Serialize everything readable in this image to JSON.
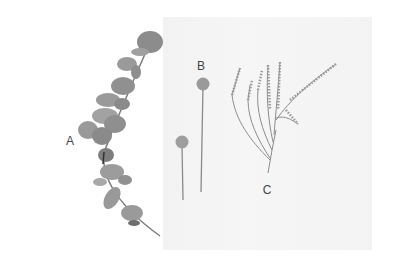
{
  "image": {
    "description": "Photo of three dried botanical specimens on a white cloth, labeled A, B and C",
    "tone": "grayscale",
    "background_color": "#ffffff",
    "cloth_color": "#f4f4f4",
    "plant_color": "#8a8a8a"
  },
  "labels": [
    {
      "id": "A",
      "text": "A",
      "subject": "eucalyptus sprig"
    },
    {
      "id": "B",
      "text": "B",
      "subject": "two billy button (craspedia) stems"
    },
    {
      "id": "C",
      "text": "C",
      "subject": "branching feathery sprig"
    }
  ]
}
